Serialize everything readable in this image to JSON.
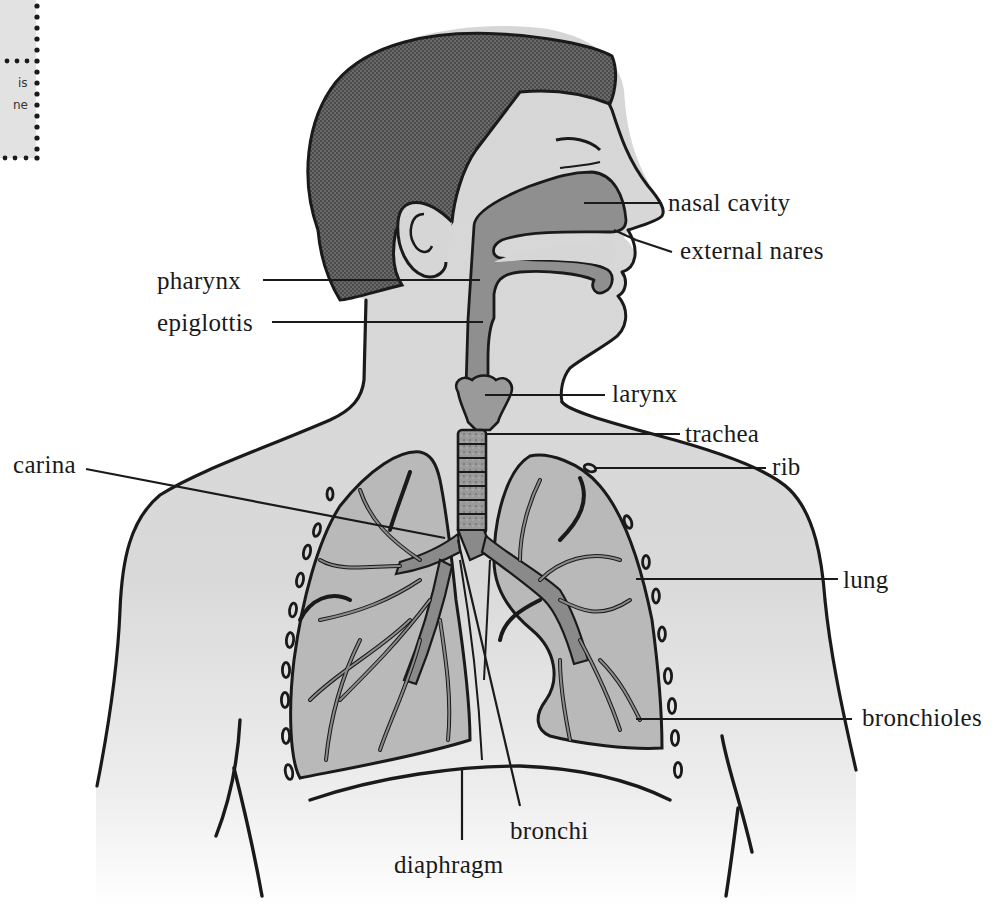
{
  "diagram": {
    "corner_note": {
      "line1": "is",
      "line2": "ne"
    },
    "labels": {
      "nasal_cavity": "nasal cavity",
      "external_nares": "external nares",
      "pharynx": "pharynx",
      "epiglottis": "epiglottis",
      "larynx": "larynx",
      "trachea": "trachea",
      "rib": "rib",
      "carina": "carina",
      "lung": "lung",
      "bronchioles": "bronchioles",
      "bronchi": "bronchi",
      "diaphragm": "diaphragm"
    },
    "colors": {
      "skin": "#d9d9d9",
      "airway": "#8f8f8f",
      "lung_tissue": "#b9b9b9",
      "hair": "#5a5a5a",
      "outline": "#1a1a1a"
    }
  }
}
